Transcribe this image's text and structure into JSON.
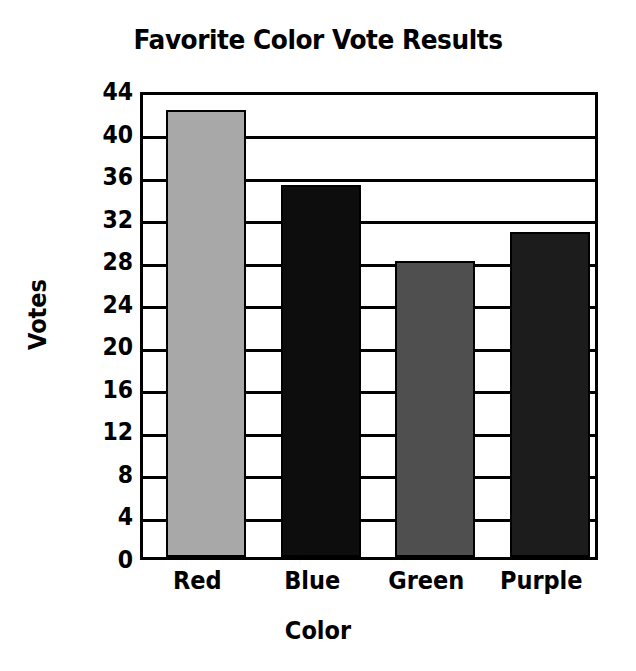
{
  "chart_data": {
    "type": "bar",
    "title": "Favorite Color Vote Results",
    "xlabel": "Color",
    "ylabel": "Votes",
    "categories": [
      "Red",
      "Blue",
      "Green",
      "Purple"
    ],
    "values": [
      42,
      35,
      27.8,
      30.6
    ],
    "ylim": [
      0,
      44
    ],
    "yticks": [
      44,
      40,
      36,
      32,
      28,
      24,
      20,
      16,
      12,
      8,
      4,
      0
    ],
    "ytick_labels": [
      "44",
      "40",
      "36",
      "32",
      "28",
      "24",
      "20",
      "16",
      "12",
      "8",
      "4",
      "0"
    ],
    "grid": true,
    "grid_axis": "y",
    "legend": false,
    "bar_colors": [
      "#a8a8a8",
      "#0d0d0d",
      "#4f4f4f",
      "#1c1c1c"
    ],
    "bar_edge_color": "#000000",
    "axis_color": "#000000",
    "background_color": "#ffffff",
    "text_color": "#000000"
  }
}
